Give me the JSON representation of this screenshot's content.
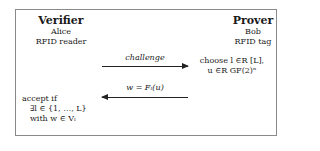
{
  "verifier": {
    "title": "Verifier",
    "name": "Alice",
    "role": "RFID reader",
    "accept_line1": "accept if",
    "accept_line2": "∃l ∈ {1, …, L}",
    "accept_line3": "with w ∈ Vₗ"
  },
  "prover": {
    "title": "Prover",
    "name": "Bob",
    "role": "RFID tag",
    "choose_line1": "choose l ∈R [L],",
    "choose_line2": "u ∈R GF(2)ⁿ"
  },
  "messages": {
    "challenge": {
      "label": "challenge",
      "direction": "verifier-to-prover"
    },
    "response": {
      "label": "w = Fₗ(u)",
      "direction": "prover-to-verifier"
    }
  },
  "colors": {
    "border": "#8a8a8a",
    "text": "#1a1a1a",
    "arrow": "#222222"
  }
}
